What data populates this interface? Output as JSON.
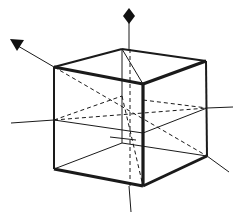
{
  "diagram": {
    "title": "",
    "type": "cube-with-axes",
    "colors": {
      "background": "#ffffff",
      "stroke": "#1a1a1a",
      "marker": "#111111"
    },
    "vertices": {
      "top_left": [
        54,
        67
      ],
      "top_back": [
        122,
        49
      ],
      "top_right": [
        206,
        61
      ],
      "top_front": [
        143,
        84
      ],
      "bottom_left": [
        54,
        169
      ],
      "bottom_back": [
        122,
        143
      ],
      "bottom_right": [
        207,
        156
      ],
      "bottom_front": [
        143,
        186
      ]
    },
    "markers": [
      {
        "name": "vertical-axis-diamond",
        "shape": "diamond",
        "at": [
          129,
          16
        ]
      },
      {
        "name": "diagonal-axis-triangle",
        "shape": "triangle-down",
        "at": [
          16,
          45
        ]
      }
    ]
  }
}
